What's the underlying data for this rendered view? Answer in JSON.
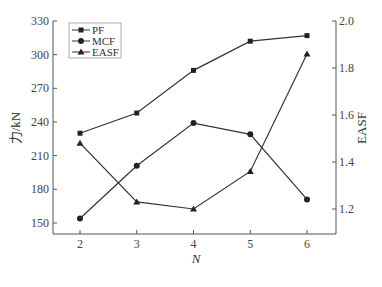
{
  "chart_data": {
    "type": "line",
    "title": "",
    "xlabel": "N",
    "ylabel": "力/kN",
    "y2label": "EASF",
    "x": [
      2,
      3,
      4,
      5,
      6
    ],
    "xticks": [
      "2",
      "3",
      "4",
      "5",
      "6"
    ],
    "yticks": [
      "150",
      "180",
      "210",
      "240",
      "270",
      "300",
      "330"
    ],
    "y2ticks": [
      "1.2",
      "1.4",
      "1.6",
      "1.8",
      "2.0"
    ],
    "ylim": [
      140,
      330
    ],
    "y2lim": [
      1.13,
      2.0
    ],
    "legend_position": "upper left",
    "grid": false,
    "series": [
      {
        "name": "PF",
        "marker": "square",
        "axis": "left",
        "values": [
          230,
          248,
          286,
          312,
          317
        ]
      },
      {
        "name": "MCF",
        "marker": "circle",
        "axis": "left",
        "values": [
          154,
          201,
          239,
          229,
          171
        ]
      },
      {
        "name": "EASF",
        "marker": "triangle",
        "axis": "right",
        "values": [
          1.48,
          1.23,
          1.2,
          1.36,
          1.86
        ]
      }
    ]
  }
}
